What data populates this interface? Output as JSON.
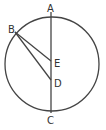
{
  "diagram": {
    "type": "geometry",
    "circle": {
      "cx": 52,
      "cy": 64,
      "r": 47
    },
    "points": {
      "A": {
        "label": "A",
        "x": 51,
        "y": 16
      },
      "B": {
        "label": "B",
        "x": 15,
        "y": 32
      },
      "C": {
        "label": "C",
        "x": 51,
        "y": 111
      },
      "D": {
        "label": "D",
        "x": 51,
        "y": 80
      },
      "E": {
        "label": "E",
        "x": 51,
        "y": 61
      }
    },
    "segments": [
      {
        "from": "A",
        "to": "C"
      },
      {
        "from": "B",
        "to": "E"
      },
      {
        "from": "B",
        "to": "D"
      }
    ],
    "colors": {
      "line": "#444444",
      "label": "#333333",
      "background": "#ffffff"
    }
  }
}
